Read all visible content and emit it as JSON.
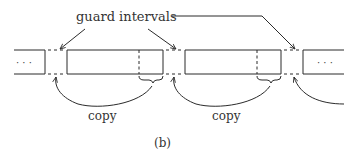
{
  "diagram": {
    "annotation_label": "guard intervals",
    "copy_labels": [
      "copy",
      "copy"
    ],
    "ellipsis_left": "· · ·",
    "ellipsis_right": "· · ·",
    "caption": "(b)",
    "colors": {
      "stroke": "#2b2b2b",
      "text": "#333333",
      "background": "#ffffff"
    }
  }
}
